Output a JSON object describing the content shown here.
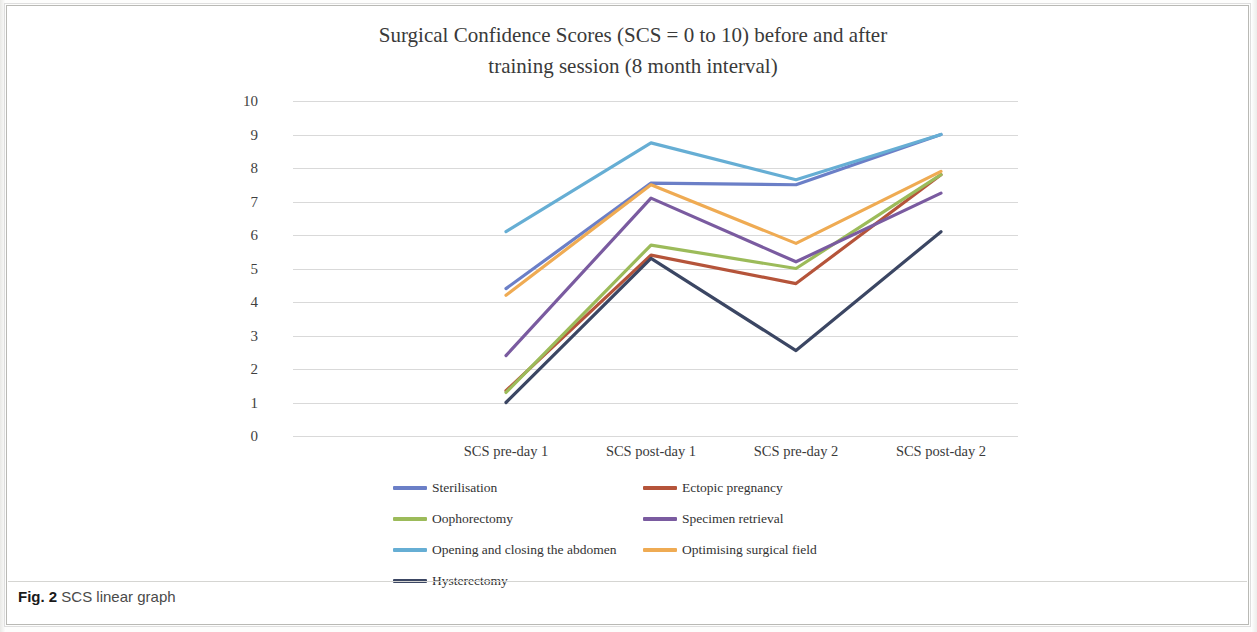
{
  "figure": {
    "caption_label": "Fig. 2",
    "caption_text": "SCS linear graph"
  },
  "chart_data": {
    "type": "line",
    "title": "Surgical Confidence Scores (SCS = 0 to 10) before and after training session (8 month interval)",
    "title_line1": "Surgical Confidence Scores (SCS = 0 to 10) before and after",
    "title_line2": "training session (8 month interval)",
    "xlabel": "",
    "ylabel": "",
    "ylim": [
      0,
      10
    ],
    "ytick_labels": [
      "10",
      "9",
      "8",
      "7",
      "6",
      "5",
      "4",
      "3",
      "2",
      "1",
      "0"
    ],
    "yticks": [
      10,
      9,
      8,
      7,
      6,
      5,
      4,
      3,
      2,
      1,
      0
    ],
    "grid": true,
    "legend_position": "bottom",
    "categories": [
      "SCS pre-day 1",
      "SCS post-day 1",
      "SCS pre-day 2",
      "SCS post-day 2"
    ],
    "series": [
      {
        "name": "Sterilisation",
        "color": "#6b7fc7",
        "values": [
          4.4,
          7.55,
          7.5,
          9.0
        ]
      },
      {
        "name": "Ectopic pregnancy",
        "color": "#b5543a",
        "values": [
          1.35,
          5.4,
          4.55,
          7.8
        ]
      },
      {
        "name": "Oophorectomy",
        "color": "#9cbb5a",
        "values": [
          1.3,
          5.7,
          5.0,
          7.8
        ]
      },
      {
        "name": "Specimen retrieval",
        "color": "#7a5ba0",
        "values": [
          2.4,
          7.1,
          5.2,
          7.25
        ]
      },
      {
        "name": "Opening and closing the abdomen",
        "color": "#66aed4",
        "values": [
          6.1,
          8.75,
          7.65,
          9.0
        ]
      },
      {
        "name": "Optimising surgical field",
        "color": "#efab53",
        "values": [
          4.2,
          7.5,
          5.75,
          7.9
        ]
      },
      {
        "name": "Hysterectomy",
        "color": "#3b4663",
        "values": [
          1.0,
          5.3,
          2.55,
          6.1
        ]
      }
    ]
  }
}
